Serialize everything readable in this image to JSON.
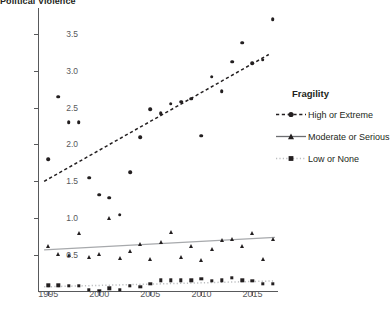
{
  "chart_title": "Political Violence",
  "legend": {
    "title": "Fragility",
    "entries": [
      {
        "label": "High or Extreme",
        "marker": "circle-icon",
        "line": "dashed"
      },
      {
        "label": "Moderate or Serious",
        "marker": "triangle-icon",
        "line": "solid"
      },
      {
        "label": "Low or None",
        "marker": "square-icon",
        "line": "dotted"
      }
    ]
  },
  "chart_data": {
    "type": "scatter",
    "title": "Political Violence",
    "xlabel": "",
    "ylabel": "",
    "xlim": [
      1994,
      2017.5
    ],
    "ylim": [
      0,
      3.85
    ],
    "xticks": [
      1995,
      2000,
      2005,
      2010,
      2015
    ],
    "yticks": [
      0.5,
      1.0,
      1.5,
      2.0,
      2.5,
      3.0,
      3.5
    ],
    "grid": false,
    "legend_position": "right",
    "series": [
      {
        "name": "High or Extreme",
        "marker": "circle",
        "trend": "dashed",
        "x": [
          1995,
          1996,
          1997,
          1998,
          1999,
          2000,
          2001,
          2002,
          2003,
          2004,
          2005,
          2006,
          2007,
          2008,
          2009,
          2010,
          2011,
          2012,
          2013,
          2014,
          2015,
          2016,
          2017
        ],
        "y": [
          1.8,
          2.65,
          2.3,
          2.3,
          1.55,
          1.32,
          1.28,
          1.05,
          1.62,
          2.1,
          2.48,
          2.42,
          2.55,
          2.58,
          2.62,
          2.12,
          2.92,
          2.72,
          3.12,
          3.38,
          3.1,
          3.15,
          3.7
        ]
      },
      {
        "name": "Moderate or Serious",
        "marker": "triangle",
        "trend": "solid",
        "x": [
          1995,
          1996,
          1997,
          1998,
          1999,
          2000,
          2001,
          2002,
          2003,
          2004,
          2005,
          2006,
          2007,
          2008,
          2009,
          2010,
          2011,
          2012,
          2013,
          2014,
          2015,
          2016,
          2017
        ],
        "y": [
          0.62,
          0.52,
          0.5,
          0.8,
          0.48,
          0.52,
          1.0,
          0.46,
          0.55,
          0.65,
          0.45,
          0.68,
          0.82,
          0.48,
          0.62,
          0.44,
          0.58,
          0.7,
          0.72,
          0.62,
          0.8,
          0.45,
          0.72
        ]
      },
      {
        "name": "Low or None",
        "marker": "square",
        "trend": "dotted",
        "x": [
          1995,
          1996,
          1997,
          1998,
          1999,
          2000,
          2001,
          2002,
          2003,
          2004,
          2005,
          2006,
          2007,
          2008,
          2009,
          2010,
          2011,
          2012,
          2013,
          2014,
          2015,
          2016,
          2017
        ],
        "y": [
          0.09,
          0.09,
          0.08,
          0.08,
          0.03,
          0.02,
          0.05,
          0.03,
          0.08,
          0.07,
          0.11,
          0.16,
          0.16,
          0.16,
          0.16,
          0.18,
          0.15,
          0.16,
          0.19,
          0.16,
          0.15,
          0.11,
          0.11
        ]
      }
    ],
    "trend_lines": [
      {
        "name": "High or Extreme",
        "style": "dashed",
        "x0": 1994.6,
        "y0": 1.5,
        "x1": 2016.6,
        "y1": 3.22,
        "color": "#231f20"
      },
      {
        "name": "Moderate or Serious",
        "style": "solid",
        "x0": 1994.6,
        "y0": 0.57,
        "x1": 2017.2,
        "y1": 0.74,
        "color": "#a7a9ac"
      },
      {
        "name": "Low or None",
        "style": "dotted",
        "x0": 1994.6,
        "y0": 0.07,
        "x1": 2017.2,
        "y1": 0.15,
        "color": "#bcbec0"
      }
    ]
  }
}
